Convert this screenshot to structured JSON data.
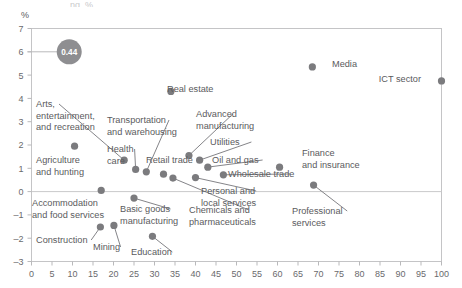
{
  "axis_unit_label": "%",
  "partial_top_text": "ng, %",
  "legend": {
    "bubble_value": "0.44"
  },
  "colors": {
    "dot": "#7b7b7e",
    "bubble": "#8e8e91",
    "axis": "#b9b9bb",
    "zero_line": "#c9c9cb",
    "text": "#59595c",
    "leader": "#76767a",
    "frame": "#c4c4c6"
  },
  "chart_data": {
    "type": "scatter",
    "title": "",
    "xlabel": "",
    "ylabel": "%",
    "xlim": [
      0,
      100
    ],
    "ylim": [
      -3,
      7
    ],
    "grid": false,
    "legend_position": "top-left-bubble",
    "xticks": [
      0,
      5,
      10,
      15,
      20,
      25,
      30,
      35,
      40,
      45,
      50,
      55,
      60,
      65,
      70,
      75,
      80,
      85,
      90,
      95,
      100
    ],
    "yticks": [
      -3,
      -2,
      -1,
      0,
      1,
      2,
      3,
      4,
      5,
      6,
      7
    ],
    "bubble_legend_value": 0.44,
    "points": [
      {
        "label": "Media",
        "x": 68.5,
        "y": 5.35,
        "lx": 332,
        "ly": 67,
        "anchor": "start",
        "leader": false
      },
      {
        "label": "ICT sector",
        "x": 100,
        "y": 4.75,
        "lx": 421,
        "ly": 82,
        "anchor": "end",
        "leader": false
      },
      {
        "label": "Real estate",
        "x": 34.0,
        "y": 4.3,
        "lx": 167,
        "ly": 92,
        "anchor": "start",
        "leader": false
      },
      {
        "label": "Arts, entertainment, and recreation",
        "x": 22.6,
        "y": 1.35,
        "lx": 36,
        "ly": 107,
        "anchor": "start",
        "leader": true
      },
      {
        "label": "Transportation and warehousing",
        "x": 28.0,
        "y": 0.85,
        "lx": 107,
        "ly": 123,
        "anchor": "start",
        "leader": true
      },
      {
        "label": "Advanced manufacturing",
        "x": 38.4,
        "y": 1.55,
        "lx": 196,
        "ly": 117,
        "anchor": "start",
        "leader": true
      },
      {
        "label": "Utilities",
        "x": 41.0,
        "y": 1.35,
        "lx": 210,
        "ly": 145,
        "anchor": "start",
        "leader": true
      },
      {
        "label": "Agriculture and hunting",
        "x": 10.5,
        "y": 1.95,
        "lx": 36,
        "ly": 163,
        "anchor": "start",
        "leader": false
      },
      {
        "label": "Health care",
        "x": 25.4,
        "y": 0.95,
        "lx": 107,
        "ly": 152,
        "anchor": "start",
        "leader": true
      },
      {
        "label": "Retail trade",
        "x": 32.2,
        "y": 0.75,
        "lx": 146,
        "ly": 163,
        "anchor": "start",
        "leader": false
      },
      {
        "label": "Oil and gas",
        "x": 43.0,
        "y": 1.05,
        "lx": 212,
        "ly": 163,
        "anchor": "start",
        "leader": true
      },
      {
        "label": "Finance and insurance",
        "x": 60.5,
        "y": 1.05,
        "lx": 302,
        "ly": 156,
        "anchor": "start",
        "leader": false
      },
      {
        "label": "Wholesale trade",
        "x": 46.8,
        "y": 0.72,
        "lx": 228,
        "ly": 177,
        "anchor": "start",
        "leader": true
      },
      {
        "label": "Personal and local services",
        "x": 40.0,
        "y": 0.6,
        "lx": 201,
        "ly": 194,
        "anchor": "start",
        "leader": true
      },
      {
        "label": "Accommodation and food services",
        "x": 17.0,
        "y": 0.05,
        "lx": 32,
        "ly": 206,
        "anchor": "start",
        "leader": false
      },
      {
        "label": "Basic goods manufacturing",
        "x": 25.0,
        "y": -0.28,
        "lx": 120,
        "ly": 212,
        "anchor": "start",
        "leader": true
      },
      {
        "label": "Chemicals and pharmaceuticals",
        "x": 34.5,
        "y": 0.58,
        "lx": 189,
        "ly": 213,
        "anchor": "start",
        "leader": true
      },
      {
        "label": "Professional services",
        "x": 68.8,
        "y": 0.28,
        "lx": 292,
        "ly": 214,
        "anchor": "start",
        "leader": true
      },
      {
        "label": "Construction",
        "x": 16.8,
        "y": -1.52,
        "lx": 36,
        "ly": 243,
        "anchor": "start",
        "leader": true
      },
      {
        "label": "Mining",
        "x": 20.1,
        "y": -1.45,
        "lx": 93,
        "ly": 250,
        "anchor": "start",
        "leader": true
      },
      {
        "label": "Education",
        "x": 29.5,
        "y": -1.92,
        "lx": 131,
        "ly": 255,
        "anchor": "start",
        "leader": true
      }
    ]
  }
}
